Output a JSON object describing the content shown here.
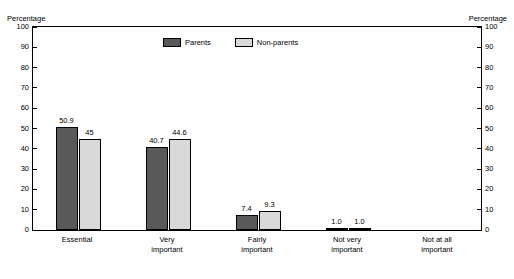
{
  "axis_titles": {
    "left": "Percentage",
    "right": "Percentage"
  },
  "legend": [
    {
      "label": "Parents",
      "color": "#595959"
    },
    {
      "label": "Non-parents",
      "color": "#d9d9d9"
    }
  ],
  "chart_data": {
    "type": "bar",
    "title": "",
    "subtitle": "",
    "xlabel": "",
    "ylabel": "Percentage",
    "ylabel_right": "Percentage",
    "ylim": [
      0,
      100
    ],
    "yticks": [
      0,
      10,
      20,
      30,
      40,
      50,
      60,
      70,
      80,
      90,
      100
    ],
    "ytick_labels": [
      "0",
      "10",
      "20",
      "30",
      "40",
      "50",
      "60",
      "70",
      "80",
      "90",
      "100"
    ],
    "grid": false,
    "legend_position": "top-center",
    "categories": [
      "Essential",
      "Very\nimportant",
      "Fairly\nimportant",
      "Not very\nimportant",
      "Not at all\nimportant"
    ],
    "category_lines": [
      [
        "Essential"
      ],
      [
        "Very",
        "important"
      ],
      [
        "Fairly",
        "important"
      ],
      [
        "Not very",
        "important"
      ],
      [
        "Not at all",
        "important"
      ]
    ],
    "series": [
      {
        "name": "Parents",
        "color": "#595959",
        "values": [
          50.9,
          40.7,
          7.4,
          1.0,
          0
        ],
        "labels": [
          "50.9",
          "40.7",
          "7.4",
          "1.0",
          ""
        ]
      },
      {
        "name": "Non-parents",
        "color": "#d9d9d9",
        "values": [
          45,
          44.6,
          9.3,
          1.0,
          0
        ],
        "labels": [
          "45",
          "44.6",
          "9.3",
          "1.0",
          ""
        ]
      }
    ]
  }
}
